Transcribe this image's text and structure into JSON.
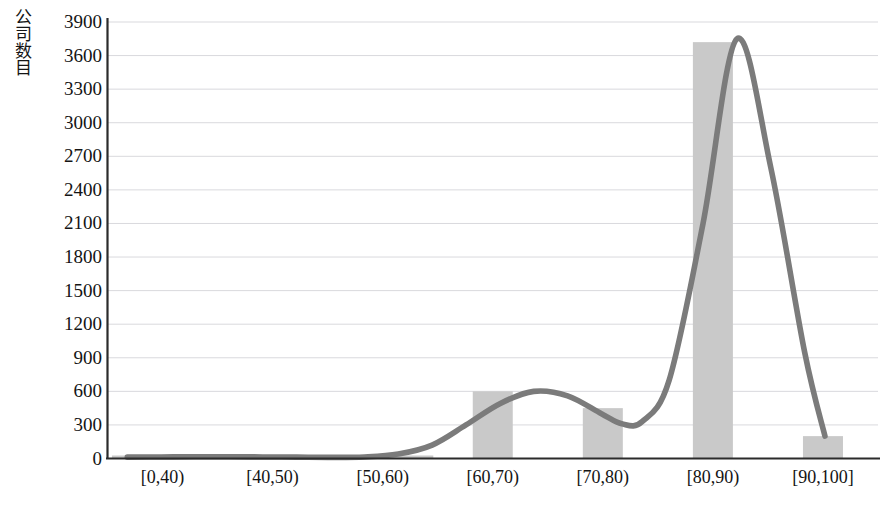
{
  "chart_data": {
    "type": "bar",
    "title": "",
    "subtitle": "",
    "xlabel": "",
    "ylabel": "公司数目",
    "categories": [
      "[0,40)",
      "[40,50)",
      "[50,60)",
      "[60,70)",
      "[70,80)",
      "[80,90)",
      "[90,100]"
    ],
    "values": [
      15,
      15,
      10,
      600,
      450,
      3720,
      200
    ],
    "series": [
      {
        "name": "公司数目",
        "type": "bar",
        "values": [
          15,
          15,
          10,
          600,
          450,
          3720,
          200
        ]
      },
      {
        "name": "分布曲线",
        "type": "line",
        "note": "smooth distribution curve overlaid on the bars",
        "points": [
          {
            "x": 0,
            "y": 12
          },
          {
            "x": 5,
            "y": 14
          },
          {
            "x": 10,
            "y": 16
          },
          {
            "x": 15,
            "y": 16
          },
          {
            "x": 20,
            "y": 14
          },
          {
            "x": 25,
            "y": 12
          },
          {
            "x": 30,
            "y": 10
          },
          {
            "x": 35,
            "y": 14
          },
          {
            "x": 40,
            "y": 40
          },
          {
            "x": 45,
            "y": 120
          },
          {
            "x": 50,
            "y": 300
          },
          {
            "x": 55,
            "y": 490
          },
          {
            "x": 60,
            "y": 600
          },
          {
            "x": 65,
            "y": 560
          },
          {
            "x": 70,
            "y": 400
          },
          {
            "x": 73,
            "y": 310
          },
          {
            "x": 76,
            "y": 330
          },
          {
            "x": 80,
            "y": 700
          },
          {
            "x": 85,
            "y": 2100
          },
          {
            "x": 90,
            "y": 3750
          },
          {
            "x": 95,
            "y": 2600
          },
          {
            "x": 100,
            "y": 950
          },
          {
            "x": 103,
            "y": 200
          }
        ]
      }
    ],
    "y_ticks": [
      0,
      300,
      600,
      900,
      1200,
      1500,
      1800,
      2100,
      2400,
      2700,
      3000,
      3300,
      3600,
      3900
    ],
    "ylim": [
      0,
      3900
    ],
    "y_tick_step": 300,
    "grid": true,
    "grid_axis": "y",
    "legend": false,
    "legend_position": "none",
    "colors": {
      "bar": "#c9c9c9",
      "curve": "#7b7b7b",
      "gridline": "#d9d9dd",
      "axis": "#2b2b2b",
      "text": "#141414",
      "background": "#ffffff"
    }
  },
  "axes": {
    "y_tick_labels": [
      "3900",
      "3600",
      "3300",
      "3000",
      "2700",
      "2400",
      "2100",
      "1800",
      "1500",
      "1200",
      "900",
      "600",
      "300",
      "0"
    ],
    "x_tick_labels": [
      "[0,40)",
      "[40,50)",
      "[50,60)",
      "[60,70)",
      "[70,80)",
      "[80,90)",
      "[90,100]"
    ],
    "y_axis_title": "公司数目"
  }
}
